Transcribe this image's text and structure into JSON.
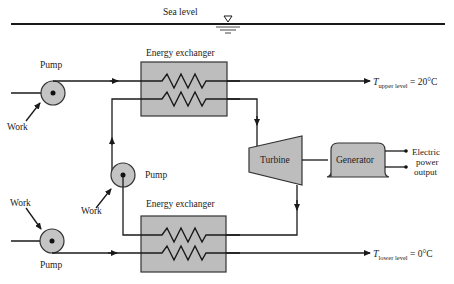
{
  "diagram": {
    "sea_level": {
      "label": "Sea level",
      "symbol": "water-level-triangle"
    },
    "components": {
      "upper_exchanger": {
        "label": "Energy exchanger"
      },
      "lower_exchanger": {
        "label": "Energy exchanger"
      },
      "turbine": {
        "label": "Turbine"
      },
      "generator": {
        "label": "Generator"
      },
      "pump_top": {
        "label": "Pump",
        "work_label": "Work"
      },
      "pump_middle": {
        "label": "Pump",
        "work_label": "Work"
      },
      "pump_bottom": {
        "label": "Pump",
        "work_label": "Work"
      }
    },
    "outputs": {
      "upper": {
        "T": "T",
        "subscript": "upper level",
        "value": " = 20°C"
      },
      "lower": {
        "T": "T",
        "subscript": "lower level",
        "value": " = 0°C"
      },
      "electric": {
        "line1": "Electric",
        "line2": "power",
        "line3": "output"
      }
    },
    "colors": {
      "fill_gray": "#bdbdbd",
      "stroke": "#1a1a1a",
      "background": "#ffffff"
    }
  }
}
